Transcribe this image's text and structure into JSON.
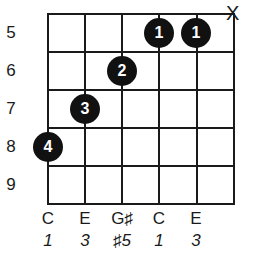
{
  "diagram": {
    "type": "guitar-chord-chart",
    "fret_numbers": [
      "5",
      "6",
      "7",
      "8",
      "9"
    ],
    "muted_string_marker": "X",
    "fingers": [
      {
        "label": "1",
        "string": 4,
        "fret": 5
      },
      {
        "label": "1",
        "string": 5,
        "fret": 5
      },
      {
        "label": "2",
        "string": 3,
        "fret": 6
      },
      {
        "label": "3",
        "string": 2,
        "fret": 7
      },
      {
        "label": "4",
        "string": 1,
        "fret": 8
      }
    ],
    "notes": [
      "C",
      "E",
      "G♯",
      "C",
      "E"
    ],
    "intervals": [
      "1",
      "3",
      "♯5",
      "1",
      "3"
    ]
  }
}
